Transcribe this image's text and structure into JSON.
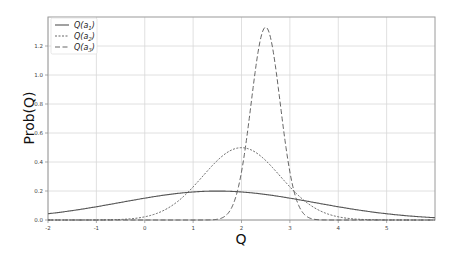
{
  "chart_data": {
    "type": "line",
    "title": "",
    "xlabel": "Q",
    "ylabel": "Prob(Q)",
    "xlim": [
      -2,
      6
    ],
    "ylim": [
      0,
      1.4
    ],
    "grid": true,
    "legend_position": "upper left",
    "x_ticks": [
      "-2",
      "-1",
      "0",
      "1",
      "2",
      "3",
      "4",
      "5"
    ],
    "y_ticks": [
      "0.0",
      "0.2",
      "0.4",
      "0.6",
      "0.8",
      "1.0",
      "1.2"
    ],
    "series": [
      {
        "name": "Q(a1)",
        "label_base": "Q(a",
        "label_sub": "1",
        "style": "solid",
        "mean": 1.5,
        "std": 2.0,
        "peak": 0.2,
        "x": [
          -2,
          -1,
          0,
          1,
          1.5,
          2,
          3,
          4,
          5,
          6
        ],
        "y": [
          0.043,
          0.092,
          0.151,
          0.193,
          0.199,
          0.193,
          0.151,
          0.092,
          0.043,
          0.016
        ]
      },
      {
        "name": "Q(a2)",
        "label_base": "Q(a",
        "label_sub": "2",
        "style": "dotted",
        "mean": 2.0,
        "std": 0.8,
        "peak": 0.5,
        "x": [
          -2,
          -1,
          0,
          1,
          2,
          3,
          4,
          5,
          6
        ],
        "y": [
          0.0,
          0.001,
          0.022,
          0.228,
          0.499,
          0.228,
          0.022,
          0.001,
          0.0
        ]
      },
      {
        "name": "Q(a3)",
        "label_base": "Q(a",
        "label_sub": "3",
        "style": "dashed",
        "mean": 2.5,
        "std": 0.3,
        "peak": 1.33,
        "x": [
          1.5,
          2.0,
          2.25,
          2.5,
          2.75,
          3.0,
          3.5
        ],
        "y": [
          0.005,
          0.333,
          0.94,
          1.33,
          0.94,
          0.333,
          0.005
        ]
      }
    ]
  },
  "colors": {
    "line": "#555555",
    "grid": "#d8d8d8",
    "axis": "#888888"
  }
}
